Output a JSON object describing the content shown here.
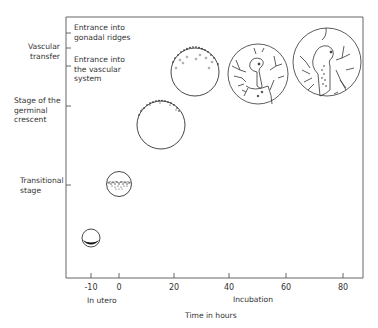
{
  "diagram": {
    "y_axis_labels": {
      "vascular_transfer": [
        "Vascular",
        "transfer"
      ],
      "germinal_crescent": [
        "Stage of the",
        "germinal",
        "crescent"
      ],
      "transitional": [
        "Transitional",
        "stage"
      ]
    },
    "inner_labels": {
      "gonadal_ridges": [
        "Entrance into",
        "gonadal ridges"
      ],
      "vascular_system": [
        "Entrance into",
        "the vascular",
        "system"
      ]
    },
    "x_axis": {
      "ticks": [
        "-10",
        "0",
        "20",
        "40",
        "60",
        "80"
      ],
      "sub_label_left": "In utero",
      "sub_label_right": "Incubation",
      "title": "Time in hours"
    },
    "stages": [
      {
        "name": "in-utero-embryo",
        "time": -10
      },
      {
        "name": "transitional-embryo",
        "time": 0
      },
      {
        "name": "germinal-crescent-embryo",
        "time": 15
      },
      {
        "name": "vascular-entry-embryo",
        "time": 28
      },
      {
        "name": "vascular-transfer-embryo",
        "time": 50
      },
      {
        "name": "gonadal-ridge-embryo",
        "time": 75
      }
    ]
  }
}
